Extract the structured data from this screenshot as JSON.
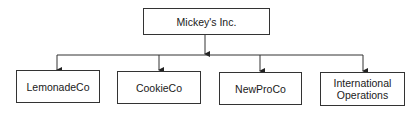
{
  "diagram": {
    "type": "org-chart",
    "root": {
      "label": "Mickey's Inc."
    },
    "children": [
      {
        "label": "LemonadeCo"
      },
      {
        "label": "CookieCo"
      },
      {
        "label": "NewProCo"
      },
      {
        "label": "International Operations"
      }
    ],
    "colors": {
      "stroke": "#333333",
      "fill": "#ffffff",
      "text": "#1a1a1a"
    }
  }
}
